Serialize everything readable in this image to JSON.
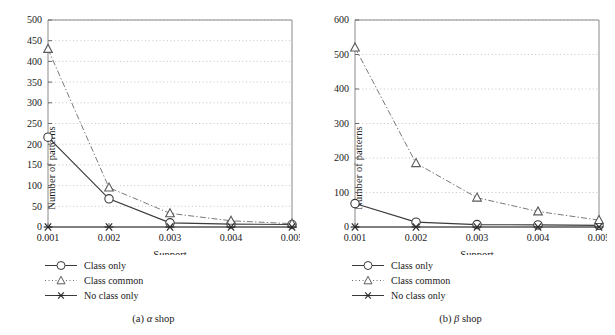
{
  "figure": {
    "panels": [
      {
        "caption_prefix": "(a)",
        "caption_symbol": "α",
        "caption_suffix": "shop",
        "chart_data": {
          "type": "line",
          "title": "",
          "xlabel": "Support",
          "ylabel": "Number of patterns",
          "x": [
            0.001,
            0.002,
            0.003,
            0.004,
            0.005
          ],
          "xticklabels": [
            "0.001",
            "0.002",
            "0.003",
            "0.004",
            "0.005"
          ],
          "yticks": [
            0,
            50,
            100,
            150,
            200,
            250,
            300,
            350,
            400,
            450,
            500
          ],
          "yticklabels": [
            "0",
            "50",
            "100",
            "150",
            "200",
            "250",
            "300",
            "350",
            "400",
            "450",
            "500"
          ],
          "ylim": [
            0,
            500
          ],
          "grid": true,
          "grid_style": "dotted",
          "legend_position": "below-axes-left",
          "series": [
            {
              "name": "Class only",
              "marker": "circle-marker",
              "line": "solid",
              "color": "#3a3a3a",
              "values": [
                217,
                68,
                10,
                7,
                6
              ]
            },
            {
              "name": "Class common",
              "marker": "triangle-marker",
              "line": "dash-dot",
              "color": "#6a6a6a",
              "values": [
                430,
                95,
                33,
                15,
                8
              ]
            },
            {
              "name": "No class only",
              "marker": "asterisk-marker",
              "line": "solid",
              "color": "#3a3a3a",
              "values": [
                0,
                0,
                0,
                0,
                0
              ]
            }
          ]
        }
      },
      {
        "caption_prefix": "(b)",
        "caption_symbol": "β",
        "caption_suffix": "shop",
        "chart_data": {
          "type": "line",
          "title": "",
          "xlabel": "Support",
          "ylabel": "Number of patterns",
          "x": [
            0.001,
            0.002,
            0.003,
            0.004,
            0.005
          ],
          "xticklabels": [
            "0.001",
            "0.002",
            "0.003",
            "0.004",
            "0.005"
          ],
          "yticks": [
            0,
            100,
            200,
            300,
            400,
            500,
            600
          ],
          "yticklabels": [
            "0",
            "100",
            "200",
            "300",
            "400",
            "500",
            "600"
          ],
          "ylim": [
            0,
            600
          ],
          "grid": true,
          "grid_style": "dotted",
          "legend_position": "below-axes-left",
          "series": [
            {
              "name": "Class only",
              "marker": "circle-marker",
              "line": "solid",
              "color": "#3a3a3a",
              "values": [
                68,
                14,
                7,
                6,
                5
              ]
            },
            {
              "name": "Class common",
              "marker": "triangle-marker",
              "line": "dash-dot",
              "color": "#6a6a6a",
              "values": [
                520,
                185,
                85,
                45,
                20
              ]
            },
            {
              "name": "No class only",
              "marker": "asterisk-marker",
              "line": "solid",
              "color": "#3a3a3a",
              "values": [
                0,
                0,
                0,
                0,
                0
              ]
            }
          ]
        }
      }
    ]
  }
}
